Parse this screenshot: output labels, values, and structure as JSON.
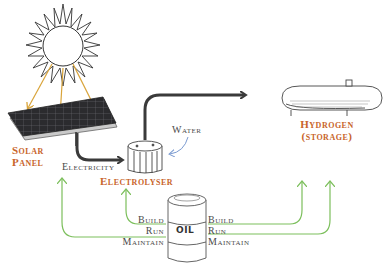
{
  "colors": {
    "label_accent": "#c8642a",
    "label_text": "#4a4a4a",
    "sun_ray_arrow": "#d9a43a",
    "energy_arrow": "#3a3a3a",
    "water_arrow": "#7a9ad0",
    "oil_input_arrow": "#7cbf5c"
  },
  "components": {
    "sun": {
      "icon": "sun-icon"
    },
    "solar_panel": {
      "label_line1": "Solar",
      "label_line2": "Panel",
      "icon": "solar-panel-icon"
    },
    "electrolyser": {
      "label": "Electrolyser",
      "icon": "electrolyser-icon"
    },
    "hydrogen": {
      "label_line1": "Hydrogen",
      "label_line2": "(storage)",
      "icon": "hydrogen-tank-icon"
    },
    "oil": {
      "label": "OIL",
      "icon": "oil-barrel-icon"
    }
  },
  "flows": {
    "electricity": "Electricity",
    "water": "Water"
  },
  "oil_uses_left": [
    "Build",
    "Run",
    "Maintain"
  ],
  "oil_uses_right": [
    "Build",
    "Run",
    "Maintain"
  ]
}
